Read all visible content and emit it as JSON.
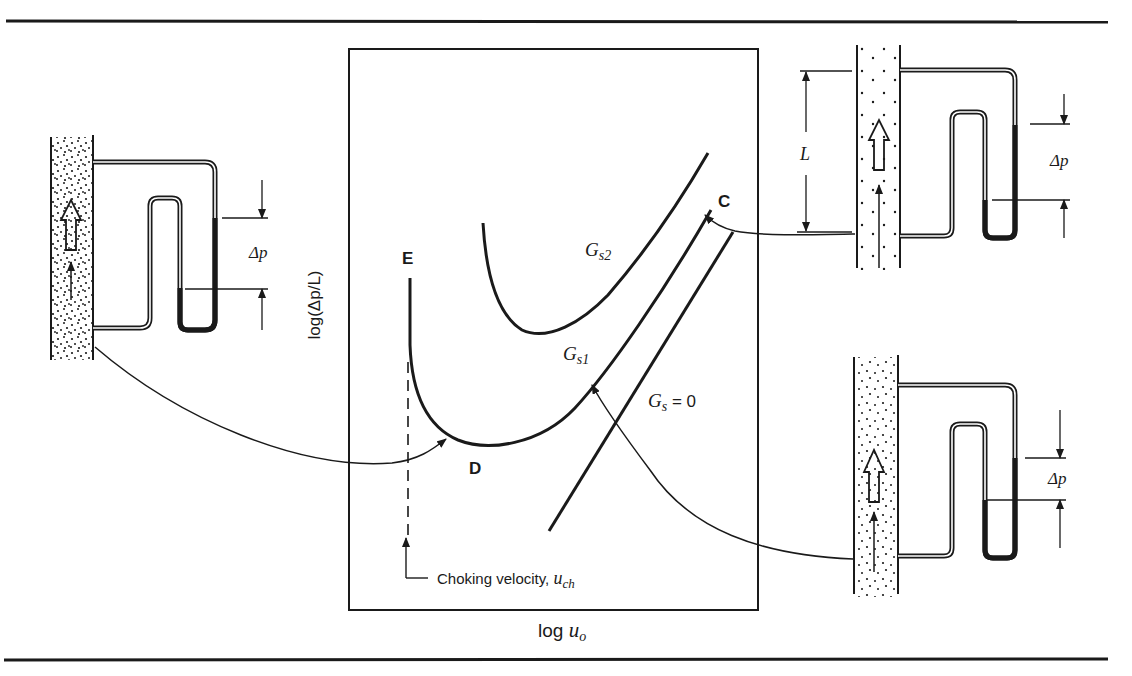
{
  "figure": {
    "y_axis_label": "log(Δp/L)",
    "x_axis_label_prefix": "log ",
    "x_axis_label_var": "u",
    "x_axis_label_sub": "o",
    "points": {
      "E": "E",
      "D": "D",
      "C": "C"
    },
    "curves": {
      "gs2_main": "G",
      "gs2_sub": "s2",
      "gs1_main": "G",
      "gs1_sub": "s1",
      "gs0_main": "G",
      "gs0_sub": "s",
      "gs0_eq": " = 0"
    },
    "choking_label": "Choking velocity, ",
    "choking_var": "u",
    "choking_sub": "ch",
    "manometers": {
      "left": {
        "dp_label": "Δp"
      },
      "top_right": {
        "dp_label": "Δp",
        "length_label": "L"
      },
      "bottom_right": {
        "dp_label": "Δp"
      }
    },
    "colors": {
      "ink": "#1a1a1a",
      "background": "#ffffff"
    }
  }
}
